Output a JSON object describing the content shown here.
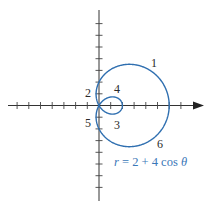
{
  "figure": {
    "equation": {
      "lhs": "r",
      "eq": " = 2 + 4 cos ",
      "theta": "θ",
      "full": "r = 2 + 4 cos θ"
    },
    "point_labels": [
      {
        "id": "1",
        "text": "1"
      },
      {
        "id": "2",
        "text": "2"
      },
      {
        "id": "3",
        "text": "3"
      },
      {
        "id": "4",
        "text": "4"
      },
      {
        "id": "5",
        "text": "5"
      },
      {
        "id": "6",
        "text": "6"
      }
    ],
    "colors": {
      "curve": "#2f6fb0",
      "axes": "#333333",
      "equation": "#3a78b8"
    }
  },
  "chart_data": {
    "type": "polar-curve",
    "title": "",
    "equation": "r = 2 + 4 cos θ",
    "curve": "limaçon with inner loop",
    "x_range": [
      -8,
      9
    ],
    "y_range": [
      -8,
      8
    ],
    "tick_spacing": 1,
    "tick_labels": "none",
    "intercepts": {
      "x": [
        6,
        2,
        0
      ],
      "y": [
        2,
        -2
      ]
    },
    "annotations": [
      "1",
      "2",
      "3",
      "4",
      "5",
      "6"
    ],
    "grid": false
  }
}
